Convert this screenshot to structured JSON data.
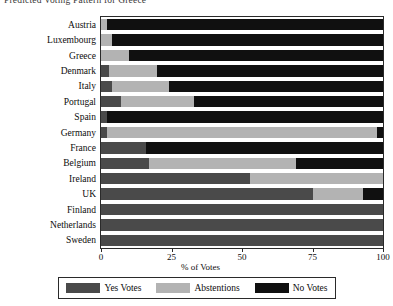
{
  "chart_data": {
    "type": "bar",
    "orientation": "horizontal",
    "stacked": true,
    "title": "Predicted Voting Pattern for Greece",
    "xlabel": "% of Votes",
    "ylabel": "",
    "xlim": [
      0,
      100
    ],
    "xticks": [
      0,
      25,
      50,
      75,
      100
    ],
    "xticklabels": [
      "0",
      "25",
      "50",
      "75",
      "100"
    ],
    "grid": false,
    "legend_position": "below",
    "categories": [
      "Austria",
      "Luxembourg",
      "Greece",
      "Denmark",
      "Italy",
      "Portugal",
      "Spain",
      "Germany",
      "France",
      "Belgium",
      "Ireland",
      "UK",
      "Finland",
      "Netherlands",
      "Sweden"
    ],
    "series": [
      {
        "name": "Yes Votes",
        "color": "#4a4a4a",
        "values": [
          0,
          0,
          0,
          0,
          3,
          0,
          2,
          14,
          0,
          0,
          0,
          0,
          100,
          100,
          100
        ]
      },
      {
        "name": "Abstentions",
        "color": "#b3b3b3",
        "values": [
          2,
          4,
          10,
          20,
          10,
          17,
          0,
          0,
          0,
          0,
          0,
          0,
          0,
          0,
          0
        ]
      },
      {
        "name": "No Votes",
        "color": "#101010",
        "values": [
          98,
          96,
          90,
          80,
          87,
          83,
          98,
          86,
          100,
          100,
          100,
          100,
          0,
          0,
          0
        ]
      }
    ],
    "bars": [
      {
        "category": "Austria",
        "yes": 0,
        "abstentions": 2,
        "no": 98
      },
      {
        "category": "Luxembourg",
        "yes": 0,
        "abstentions": 4,
        "no": 96
      },
      {
        "category": "Greece",
        "yes": 0,
        "abstentions": 10,
        "no": 90
      },
      {
        "category": "Denmark",
        "yes": 3,
        "abstentions": 17,
        "no": 80
      },
      {
        "category": "Italy",
        "yes": 4,
        "abstentions": 20,
        "no": 76
      },
      {
        "category": "Portugal",
        "yes": 7,
        "abstentions": 26,
        "no": 67
      },
      {
        "category": "Spain",
        "yes": 2,
        "abstentions": 0,
        "no": 98
      },
      {
        "category": "Germany",
        "yes": 2,
        "abstentions": 96,
        "no": 2
      },
      {
        "category": "France",
        "yes": 16,
        "abstentions": 0,
        "no": 84
      },
      {
        "category": "Belgium",
        "yes": 17,
        "abstentions": 52,
        "no": 31
      },
      {
        "category": "Ireland",
        "yes": 53,
        "abstentions": 47,
        "no": 0
      },
      {
        "category": "UK",
        "yes": 75,
        "abstentions": 18,
        "no": 7
      },
      {
        "category": "Finland",
        "yes": 100,
        "abstentions": 0,
        "no": 0
      },
      {
        "category": "Netherlands",
        "yes": 100,
        "abstentions": 0,
        "no": 0
      },
      {
        "category": "Sweden",
        "yes": 100,
        "abstentions": 0,
        "no": 0
      }
    ],
    "legend": [
      {
        "label": "Yes Votes",
        "color": "#4a4a4a"
      },
      {
        "label": "Abstentions",
        "color": "#b3b3b3"
      },
      {
        "label": "No Votes",
        "color": "#101010"
      }
    ]
  }
}
